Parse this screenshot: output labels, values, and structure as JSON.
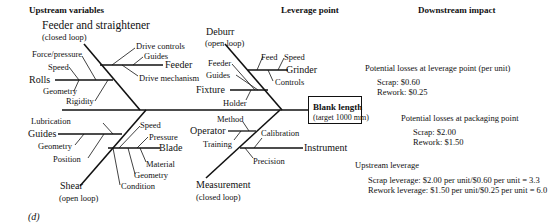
{
  "headers": {
    "upstream": "Upstream variables",
    "leverage": "Leverage point",
    "downstream": "Downstream impact"
  },
  "effect": {
    "title": "Blank length",
    "subtitle": "(target 1000 mm)"
  },
  "bones": {
    "feeder_straightener": {
      "label": "Feeder and straightener",
      "note": "(closed loop)",
      "branches": {
        "feeder": {
          "label": "Feeder",
          "causes": [
            "Drive controls",
            "Guides",
            "Drive mechanism"
          ]
        },
        "rolls": {
          "label": "Rolls",
          "causes": [
            "Force/pressure",
            "Speed",
            "Geometry",
            "Rigidity"
          ]
        }
      }
    },
    "deburr": {
      "label": "Deburr",
      "note": "(open loop)",
      "branches": {
        "grinder": {
          "label": "Grinder",
          "causes": [
            "Feed",
            "Speed",
            "Controls"
          ]
        },
        "fixture": {
          "label": "Fixture",
          "causes": [
            "Feeder",
            "Guides",
            "Holder"
          ]
        }
      }
    },
    "shear": {
      "label": "Shear",
      "note": "(open loop)",
      "branches": {
        "guides": {
          "label": "Guides",
          "causes": [
            "Lubrication",
            "Geometry",
            "Position"
          ]
        },
        "blade": {
          "label": "Blade",
          "causes": [
            "Speed",
            "Pressure",
            "Material",
            "Geometry",
            "Condition"
          ]
        }
      }
    },
    "measurement": {
      "label": "Measurement",
      "note": "(closed loop)",
      "branches": {
        "operator": {
          "label": "Operator",
          "causes": [
            "Method",
            "Training"
          ]
        },
        "instrument": {
          "label": "Instrument",
          "causes": [
            "Calibration",
            "Precision"
          ]
        }
      }
    }
  },
  "impact": {
    "leverage_point": {
      "title": "Potential losses at leverage point (per unit)",
      "scrap": "Scrap: $0.60",
      "rework": "Rework: $0.25"
    },
    "packaging_point": {
      "title": "Potential losses at packaging point",
      "scrap": "Scrap: $2.00",
      "rework": "Rework: $1.50"
    },
    "upstream_leverage": {
      "title": "Upstream leverage",
      "scrap": "Scrap leverage: $2.00 per unit/$0.60 per unit = 3.3",
      "rework": "Rework leverage: $1.50 per unit/$0.25 per unit = 6.0"
    }
  },
  "figure_label": "(d)"
}
